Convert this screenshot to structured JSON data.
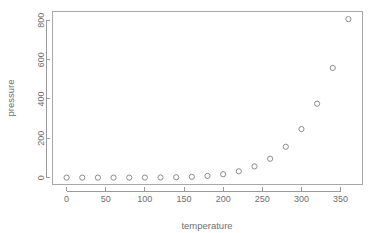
{
  "chart_data": {
    "type": "scatter",
    "title": "",
    "xlabel": "temperature",
    "ylabel": "pressure",
    "xlim": [
      -18,
      378
    ],
    "ylim": [
      -35,
      845
    ],
    "grid": false,
    "legend": null,
    "marker": "open-circle",
    "x": [
      0,
      20,
      40,
      60,
      80,
      100,
      120,
      140,
      160,
      180,
      200,
      220,
      240,
      260,
      280,
      300,
      320,
      340,
      360
    ],
    "y": [
      0.0002,
      0.0012,
      0.006,
      0.03,
      0.09,
      0.27,
      0.75,
      1.85,
      4.2,
      8.8,
      17.3,
      32.1,
      57.0,
      96.0,
      157.0,
      247.0,
      376.0,
      558.0,
      806.0
    ],
    "points": [
      {
        "x": 0,
        "y": 0.0002
      },
      {
        "x": 20,
        "y": 0.0012
      },
      {
        "x": 40,
        "y": 0.006
      },
      {
        "x": 60,
        "y": 0.03
      },
      {
        "x": 80,
        "y": 0.09
      },
      {
        "x": 100,
        "y": 0.27
      },
      {
        "x": 120,
        "y": 0.75
      },
      {
        "x": 140,
        "y": 1.85
      },
      {
        "x": 160,
        "y": 4.2
      },
      {
        "x": 180,
        "y": 8.8
      },
      {
        "x": 200,
        "y": 17.3
      },
      {
        "x": 220,
        "y": 32.1
      },
      {
        "x": 240,
        "y": 57.0
      },
      {
        "x": 260,
        "y": 96.0
      },
      {
        "x": 280,
        "y": 157.0
      },
      {
        "x": 300,
        "y": 247.0
      },
      {
        "x": 320,
        "y": 376.0
      },
      {
        "x": 340,
        "y": 558.0
      },
      {
        "x": 360,
        "y": 806.0
      }
    ],
    "xticks": [
      0,
      50,
      100,
      150,
      200,
      250,
      300,
      350
    ],
    "xtick_labels": [
      "0",
      "50",
      "100",
      "150",
      "200",
      "250",
      "300",
      "350"
    ],
    "yticks": [
      0,
      200,
      400,
      600,
      800
    ],
    "ytick_labels": [
      "0",
      "200",
      "400",
      "600",
      "800"
    ],
    "colors": {
      "marker_stroke": "#8c8c8c",
      "axis": "#9a9a9a",
      "box": "#a8a8a8",
      "text": "#6e6e6e",
      "background": "#ffffff"
    }
  }
}
